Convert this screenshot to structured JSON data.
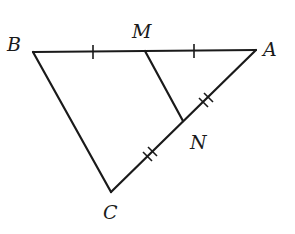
{
  "diagram": {
    "points": {
      "B": {
        "label": "B",
        "x": 33,
        "y": 52
      },
      "M": {
        "label": "M",
        "x": 145,
        "y": 51
      },
      "A": {
        "label": "A",
        "x": 256,
        "y": 50
      },
      "N": {
        "label": "N",
        "x": 183,
        "y": 121
      },
      "C": {
        "label": "C",
        "x": 111,
        "y": 192
      }
    },
    "segments": [
      "BA",
      "BC",
      "CA",
      "MN"
    ],
    "tick_marks": [
      {
        "segment": "BM",
        "count": 1
      },
      {
        "segment": "MA",
        "count": 1
      },
      {
        "segment": "AN",
        "count": 2
      },
      {
        "segment": "NC",
        "count": 2
      }
    ],
    "line_color": "#1a1a1a"
  }
}
